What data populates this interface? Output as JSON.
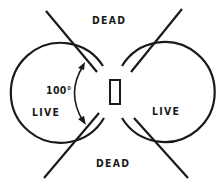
{
  "labels": {
    "dead_top": "DEAD",
    "dead_bottom": "DEAD",
    "live_left": "LIVE",
    "live_right": "LIVE",
    "angle": "100°"
  },
  "colors": {
    "stroke": "#1a1a1a",
    "background": "#ffffff"
  }
}
